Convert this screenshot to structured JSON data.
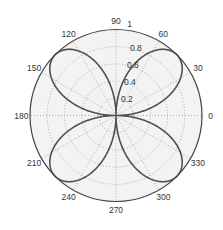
{
  "chart_data": {
    "type": "polar-line",
    "title": "",
    "function": "r = |sin(2θ)|",
    "theta_ticks_deg": [
      0,
      30,
      60,
      90,
      120,
      150,
      180,
      210,
      240,
      270,
      300,
      330
    ],
    "theta_labels": [
      "0",
      "30",
      "60",
      "90",
      "120",
      "150",
      "180",
      "210",
      "240",
      "270",
      "300",
      "330"
    ],
    "r_ticks": [
      0.2,
      0.4,
      0.6,
      0.8,
      1
    ],
    "r_labels": [
      "0.2",
      "0.4",
      "0.6",
      "0.8",
      "1"
    ],
    "rlim": [
      0,
      1
    ],
    "grid": true,
    "series": [
      {
        "name": "rose",
        "petals": 4,
        "petal_max_r": 1,
        "petal_angles_deg": [
          45,
          135,
          225,
          315
        ],
        "sample_points": [
          {
            "theta": 0,
            "r": 0
          },
          {
            "theta": 15,
            "r": 0.5
          },
          {
            "theta": 30,
            "r": 0.87
          },
          {
            "theta": 45,
            "r": 1
          },
          {
            "theta": 60,
            "r": 0.87
          },
          {
            "theta": 75,
            "r": 0.5
          },
          {
            "theta": 90,
            "r": 0
          },
          {
            "theta": 135,
            "r": 1
          },
          {
            "theta": 180,
            "r": 0
          },
          {
            "theta": 225,
            "r": 1
          },
          {
            "theta": 270,
            "r": 0
          },
          {
            "theta": 315,
            "r": 1
          }
        ]
      }
    ]
  },
  "colors": {
    "background": "#ffffff",
    "plot_fill": "#f3f3f3",
    "outer_circle": "#444444",
    "grid": "#9a9a9a",
    "curve": "#505050",
    "text": "#333333"
  },
  "geometry": {
    "cx": 116,
    "cy": 115.5,
    "radius": 86
  }
}
